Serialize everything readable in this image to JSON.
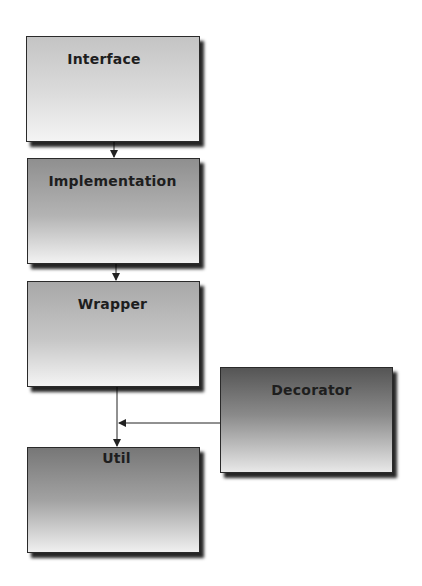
{
  "diagram": {
    "nodes": [
      {
        "id": "interface",
        "label": "Interface"
      },
      {
        "id": "implementation",
        "label": "Implementation"
      },
      {
        "id": "wrapper",
        "label": "Wrapper"
      },
      {
        "id": "decorator",
        "label": "Decorator"
      },
      {
        "id": "util",
        "label": "Util"
      }
    ],
    "edges": [
      {
        "from": "interface",
        "to": "implementation"
      },
      {
        "from": "implementation",
        "to": "wrapper"
      },
      {
        "from": "wrapper",
        "to": "util"
      },
      {
        "from": "decorator",
        "to": "util"
      }
    ]
  }
}
